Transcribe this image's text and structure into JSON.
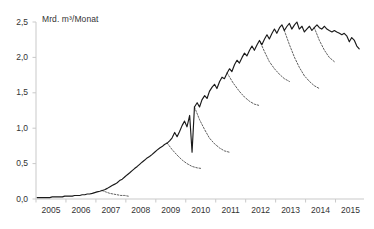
{
  "chart_data": {
    "type": "line",
    "title": "",
    "xlabel": "",
    "ylabel": "Mrd. m³/Monat",
    "ylim": [
      0.0,
      2.5
    ],
    "xlim": [
      2005.0,
      2015.95
    ],
    "grid": false,
    "legend": null,
    "ytick_labels": [
      "0,0",
      "0,5",
      "1,0",
      "1,5",
      "2,0",
      "2,5"
    ],
    "ytick_values": [
      0.0,
      0.5,
      1.0,
      1.5,
      2.0,
      2.5
    ],
    "xtick_labels": [
      "2005",
      "2006",
      "2007",
      "2008",
      "2009",
      "2010",
      "2011",
      "2012",
      "2013",
      "2014",
      "2015"
    ],
    "xtick_values": [
      2005,
      2006,
      2007,
      2008,
      2009,
      2010,
      2011,
      2012,
      2013,
      2014,
      2015
    ],
    "line_color": "#1a1a1a",
    "axis_color": "#c9c9c9",
    "series": [
      {
        "name": "Ist-Werte",
        "style": "solid",
        "x": [
          2005.04,
          2005.13,
          2005.21,
          2005.29,
          2005.38,
          2005.46,
          2005.54,
          2005.63,
          2005.71,
          2005.79,
          2005.88,
          2005.96,
          2006.04,
          2006.13,
          2006.21,
          2006.29,
          2006.38,
          2006.46,
          2006.54,
          2006.63,
          2006.71,
          2006.79,
          2006.88,
          2006.96,
          2007.04,
          2007.13,
          2007.21,
          2007.29,
          2007.38,
          2007.46,
          2007.54,
          2007.63,
          2007.71,
          2007.79,
          2007.88,
          2007.96,
          2008.04,
          2008.13,
          2008.21,
          2008.29,
          2008.38,
          2008.46,
          2008.54,
          2008.63,
          2008.71,
          2008.79,
          2008.88,
          2008.96,
          2009.04,
          2009.13,
          2009.21,
          2009.29,
          2009.38,
          2009.46,
          2009.54,
          2009.63,
          2009.71,
          2009.79,
          2009.88,
          2009.96,
          2010.04,
          2010.13,
          2010.21,
          2010.29,
          2010.38,
          2010.46,
          2010.54,
          2010.63,
          2010.71,
          2010.79,
          2010.88,
          2010.96,
          2011.04,
          2011.13,
          2011.21,
          2011.29,
          2011.38,
          2011.46,
          2011.54,
          2011.63,
          2011.71,
          2011.79,
          2011.88,
          2011.96,
          2012.04,
          2012.13,
          2012.21,
          2012.29,
          2012.38,
          2012.46,
          2012.54,
          2012.63,
          2012.71,
          2012.79,
          2012.88,
          2012.96,
          2013.04,
          2013.13,
          2013.21,
          2013.29,
          2013.38,
          2013.46,
          2013.54,
          2013.63,
          2013.71,
          2013.79,
          2013.88,
          2013.96,
          2014.04,
          2014.13,
          2014.21,
          2014.29,
          2014.38,
          2014.46,
          2014.54,
          2014.63,
          2014.71,
          2014.79,
          2014.88,
          2014.96,
          2015.04,
          2015.13,
          2015.21,
          2015.29,
          2015.38,
          2015.46,
          2015.54,
          2015.63,
          2015.71,
          2015.79
        ],
        "y": [
          0.02,
          0.02,
          0.02,
          0.02,
          0.02,
          0.02,
          0.03,
          0.03,
          0.03,
          0.03,
          0.03,
          0.04,
          0.04,
          0.04,
          0.04,
          0.05,
          0.05,
          0.05,
          0.06,
          0.06,
          0.07,
          0.07,
          0.08,
          0.09,
          0.1,
          0.11,
          0.12,
          0.13,
          0.15,
          0.17,
          0.19,
          0.21,
          0.23,
          0.26,
          0.28,
          0.31,
          0.34,
          0.37,
          0.4,
          0.43,
          0.46,
          0.49,
          0.52,
          0.55,
          0.58,
          0.6,
          0.63,
          0.66,
          0.69,
          0.72,
          0.74,
          0.77,
          0.79,
          0.82,
          0.86,
          0.94,
          0.88,
          0.95,
          1.04,
          1.1,
          1.02,
          1.18,
          0.66,
          1.3,
          1.36,
          1.3,
          1.4,
          1.46,
          1.42,
          1.52,
          1.58,
          1.62,
          1.56,
          1.66,
          1.72,
          1.7,
          1.78,
          1.84,
          1.8,
          1.9,
          1.96,
          1.92,
          2.0,
          2.06,
          2.02,
          2.1,
          2.16,
          2.1,
          2.18,
          2.24,
          2.18,
          2.26,
          2.32,
          2.26,
          2.34,
          2.4,
          2.34,
          2.42,
          2.46,
          2.38,
          2.44,
          2.48,
          2.4,
          2.46,
          2.5,
          2.4,
          2.44,
          2.36,
          2.4,
          2.44,
          2.38,
          2.42,
          2.46,
          2.42,
          2.4,
          2.44,
          2.4,
          2.38,
          2.36,
          2.38,
          2.36,
          2.34,
          2.32,
          2.34,
          2.3,
          2.22,
          2.28,
          2.24,
          2.16,
          2.12
        ]
      },
      {
        "name": "Prognose-Abzweig 2007",
        "style": "dashed",
        "x": [
          2007.2,
          2007.33,
          2007.46,
          2007.58,
          2007.71,
          2007.83,
          2007.96,
          2008.08
        ],
        "y": [
          0.12,
          0.1,
          0.08,
          0.07,
          0.06,
          0.05,
          0.05,
          0.04
        ]
      },
      {
        "name": "Prognose-Abzweig 2009",
        "style": "dashed",
        "x": [
          2009.38,
          2009.54,
          2009.71,
          2009.88,
          2010.04,
          2010.21,
          2010.38,
          2010.54
        ],
        "y": [
          0.79,
          0.7,
          0.62,
          0.55,
          0.5,
          0.46,
          0.44,
          0.43
        ]
      },
      {
        "name": "Prognose-Abzweig 2010",
        "style": "dashed",
        "x": [
          2010.29,
          2010.46,
          2010.63,
          2010.79,
          2010.96,
          2011.13,
          2011.29,
          2011.46
        ],
        "y": [
          1.3,
          1.12,
          0.98,
          0.86,
          0.78,
          0.72,
          0.68,
          0.66
        ]
      },
      {
        "name": "Prognose-Abzweig 2011",
        "style": "dashed",
        "x": [
          2011.38,
          2011.58,
          2011.79,
          2011.96,
          2012.13,
          2012.29,
          2012.46
        ],
        "y": [
          1.78,
          1.64,
          1.52,
          1.44,
          1.38,
          1.34,
          1.32
        ]
      },
      {
        "name": "Prognose-Abzweig 2012",
        "style": "dashed",
        "x": [
          2012.46,
          2012.63,
          2012.79,
          2012.96,
          2013.13,
          2013.29,
          2013.46
        ],
        "y": [
          2.24,
          2.08,
          1.94,
          1.84,
          1.76,
          1.7,
          1.66
        ]
      },
      {
        "name": "Prognose-Abzweig 2013",
        "style": "dashed",
        "x": [
          2013.29,
          2013.46,
          2013.63,
          2013.79,
          2013.96,
          2014.13,
          2014.29,
          2014.46
        ],
        "y": [
          2.38,
          2.18,
          2.0,
          1.86,
          1.74,
          1.66,
          1.6,
          1.56
        ]
      },
      {
        "name": "Prognose-Abzweig 2014",
        "style": "dashed",
        "x": [
          2014.29,
          2014.46,
          2014.63,
          2014.79,
          2014.96
        ],
        "y": [
          2.42,
          2.24,
          2.1,
          2.0,
          1.94
        ]
      }
    ]
  }
}
